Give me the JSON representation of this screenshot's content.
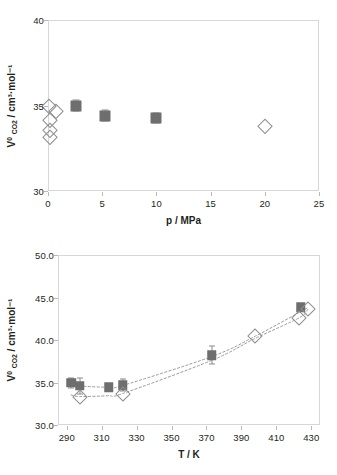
{
  "figure": {
    "background": "#ffffff",
    "frame_color": "#d7d7d7",
    "marker_fill": "#6e6e6e",
    "marker_open_stroke": "#8e8e8e",
    "errorbar_color": "#8a8a8a",
    "curve_color": "#9a9a9a"
  },
  "chart_data": [
    {
      "type": "scatter",
      "id": "panel-a",
      "title": "",
      "xlabel": "p / MPa",
      "ylabel": "V° CO2 / cm³·mol⁻¹",
      "ylabel_parts": {
        "symbol": "V",
        "superscript": "0",
        "subscript": "CO2",
        "units": " / cm³·mol⁻¹"
      },
      "xlim": [
        0,
        25
      ],
      "ylim": [
        30,
        40
      ],
      "xticks": [
        0,
        5,
        10,
        15,
        20,
        25
      ],
      "yticks": [
        30,
        35,
        40
      ],
      "xtick_labels": [
        "0",
        "5",
        "10",
        "15",
        "20",
        "25"
      ],
      "ytick_labels": [
        "30",
        "35",
        "40"
      ],
      "grid": false,
      "legend": "none",
      "series": [
        {
          "name": "filled-squares",
          "marker": "filled-square",
          "points": [
            {
              "x": 2.6,
              "y": 35.0,
              "yerr": 0.3
            },
            {
              "x": 5.3,
              "y": 34.4,
              "yerr": 0.32
            },
            {
              "x": 10.0,
              "y": 34.25,
              "yerr": 0.3
            }
          ]
        },
        {
          "name": "open-diamonds",
          "marker": "open-diamond",
          "points": [
            {
              "x": 0.1,
              "y": 34.95
            },
            {
              "x": 0.75,
              "y": 34.65
            },
            {
              "x": 0.15,
              "y": 34.15
            },
            {
              "x": 0.15,
              "y": 33.55
            },
            {
              "x": 0.15,
              "y": 33.15
            },
            {
              "x": 20.0,
              "y": 33.8
            }
          ]
        }
      ]
    },
    {
      "type": "scatter",
      "id": "panel-b",
      "title": "",
      "xlabel": "T / K",
      "ylabel": "V° CO2 / cm³·mol⁻¹",
      "ylabel_parts": {
        "symbol": "V",
        "superscript": "0",
        "subscript": "CO2",
        "units": " / cm³·mol⁻¹"
      },
      "xlim": [
        285,
        435
      ],
      "ylim": [
        30.0,
        50.0
      ],
      "xticks": [
        290,
        310,
        330,
        350,
        370,
        390,
        410,
        430
      ],
      "yticks": [
        30.0,
        35.0,
        40.0,
        45.0,
        50.0
      ],
      "xtick_labels": [
        "290",
        "310",
        "330",
        "350",
        "370",
        "390",
        "410",
        "430"
      ],
      "ytick_labels": [
        "30.0",
        "35.0",
        "40.0",
        "45.0",
        "50.0"
      ],
      "grid": false,
      "legend": "none",
      "series": [
        {
          "name": "filled-squares",
          "marker": "filled-square",
          "points": [
            {
              "x": 292.5,
              "y": 34.95,
              "yerr": 0.55
            },
            {
              "x": 297.5,
              "y": 34.6,
              "yerr": 0.95
            },
            {
              "x": 314.0,
              "y": 34.45,
              "yerr": 0.35
            },
            {
              "x": 322.0,
              "y": 34.7,
              "yerr": 0.75
            },
            {
              "x": 373.0,
              "y": 38.2,
              "yerr": 1.05
            },
            {
              "x": 424.0,
              "y": 43.85,
              "yerr": 0.4
            }
          ]
        },
        {
          "name": "open-diamonds",
          "marker": "open-diamond",
          "points": [
            {
              "x": 297.5,
              "y": 33.35
            },
            {
              "x": 322.0,
              "y": 33.7
            },
            {
              "x": 398.0,
              "y": 40.45
            },
            {
              "x": 423.0,
              "y": 42.6
            },
            {
              "x": 428.0,
              "y": 43.7
            }
          ]
        },
        {
          "name": "upper-dotted-curve",
          "marker": "dotted-line",
          "points": [
            {
              "x": 292.5,
              "y": 34.9
            },
            {
              "x": 297.5,
              "y": 34.6
            },
            {
              "x": 314.0,
              "y": 34.45
            },
            {
              "x": 322.0,
              "y": 34.65
            },
            {
              "x": 373.0,
              "y": 38.05
            },
            {
              "x": 398.0,
              "y": 40.45
            },
            {
              "x": 428.0,
              "y": 43.8
            }
          ]
        },
        {
          "name": "lower-dotted-curve",
          "marker": "dotted-line",
          "points": [
            {
              "x": 292.5,
              "y": 33.55
            },
            {
              "x": 297.5,
              "y": 33.35
            },
            {
              "x": 314.0,
              "y": 33.45
            },
            {
              "x": 322.0,
              "y": 33.7
            },
            {
              "x": 373.0,
              "y": 37.6
            },
            {
              "x": 398.0,
              "y": 40.2
            },
            {
              "x": 423.0,
              "y": 42.6
            },
            {
              "x": 428.0,
              "y": 43.6
            }
          ]
        }
      ]
    }
  ]
}
